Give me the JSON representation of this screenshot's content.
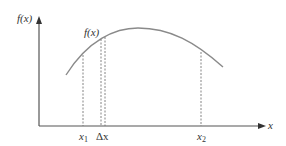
{
  "diagram": {
    "axes": {
      "y_label": "f(x)",
      "x_label": "x"
    },
    "curve": {
      "label": "f(x)",
      "color": "#8a8a8a"
    },
    "markers": [
      {
        "id": "x1",
        "label": "x",
        "subscript": "1",
        "style": "dashed"
      },
      {
        "id": "dx",
        "label": "Δx",
        "style": "dashed-pair"
      },
      {
        "id": "x2",
        "label": "x",
        "subscript": "2",
        "style": "dashed"
      }
    ],
    "colors": {
      "axis": "#555555",
      "curve": "#8a8a8a",
      "dashed": "#777777",
      "text": "#333333"
    }
  }
}
